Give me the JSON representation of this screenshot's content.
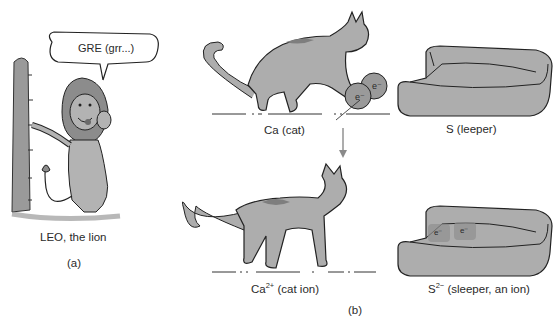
{
  "figure": {
    "panel_a": {
      "speech_bubble": "GRE (grr...)",
      "caption": "LEO, the lion",
      "panel_label": "(a)"
    },
    "panel_b": {
      "cat_neutral_caption": "Ca (cat)",
      "sleeper_neutral_caption": "S (leeper)",
      "cat_ion_caption_base": "Ca",
      "cat_ion_charge": "2+",
      "cat_ion_caption_rest": " (cat ion)",
      "sleeper_ion_caption_base": "S",
      "sleeper_ion_charge": "2−",
      "sleeper_ion_caption_rest": " (sleeper, an ion)",
      "electron_label": "e⁻",
      "panel_label": "(b)"
    },
    "colors": {
      "fill_gray": "#a9a9a9",
      "dark_gray": "#7a7a7a",
      "outline": "#1e1e1e",
      "arrow": "#8a8a8a"
    }
  }
}
